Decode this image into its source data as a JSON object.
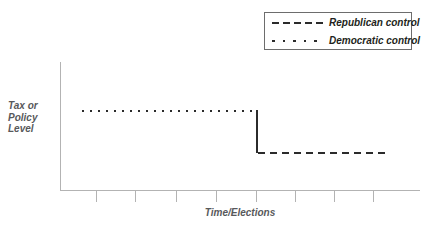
{
  "figure": {
    "background": "#ffffff",
    "line_color": "#2b2b2b",
    "axis_color": "#b3b3b3",
    "label_color": "#58595b"
  },
  "axes": {
    "y_title_lines": [
      "Tax or",
      "Policy",
      "Level"
    ],
    "y_title_text": "Tax or Policy Level",
    "x_title": "Time/Elections",
    "tick_count": 8
  },
  "legend": {
    "position": "top-right",
    "border_color": "#6d6d6d",
    "entries": [
      {
        "label": "Republican control",
        "style": "dashed",
        "color": "#2b2b2b"
      },
      {
        "label": "Democratic control",
        "style": "dotted",
        "color": "#2b2b2b"
      }
    ]
  },
  "chart_data": {
    "type": "line",
    "title": "",
    "subtitle": "",
    "xlabel": "Time/Elections",
    "ylabel": "Tax or Policy Level",
    "grid": false,
    "legend_position": "top-right",
    "x_tick_labels": [
      "",
      "",
      "",
      "",
      "",
      "",
      "",
      ""
    ],
    "y_tick_labels": [],
    "xlim": [
      0,
      10
    ],
    "ylim": [
      0,
      10
    ],
    "annotations": [
      {
        "text": "vertical drop at election where control changes",
        "x": 5.45,
        "y_from": 6.2,
        "y_to": 3.0
      }
    ],
    "series": [
      {
        "name": "Democratic control",
        "style": "dotted",
        "color": "#2b2b2b",
        "description": "high, flat tax/policy level before the change of control",
        "x": [
          0.6,
          5.45
        ],
        "y": [
          6.2,
          6.2
        ]
      },
      {
        "name": "Republican control",
        "style": "dashed",
        "color": "#2b2b2b",
        "description": "lower, flat tax/policy level after the change of control",
        "x": [
          5.5,
          9.25
        ],
        "y": [
          3.0,
          3.0
        ]
      }
    ]
  },
  "geometry": {
    "y_axis": {
      "x": 60,
      "top": 62,
      "bottom": 191
    },
    "x_axis": {
      "y": 190,
      "left": 60,
      "right": 420
    },
    "tick_x": [
      96,
      135,
      176,
      216,
      256,
      295,
      334,
      373
    ],
    "dotted_line": {
      "y": 110,
      "x_start": 82,
      "x_end": 256,
      "dot": 2,
      "gap": 6
    },
    "dashed_line": {
      "y": 152,
      "x_start": 258,
      "x_end": 392,
      "dash": 7,
      "gap": 5
    },
    "drop_line": {
      "x": 256,
      "y_top": 110,
      "y_bottom": 153,
      "width": 2
    }
  }
}
